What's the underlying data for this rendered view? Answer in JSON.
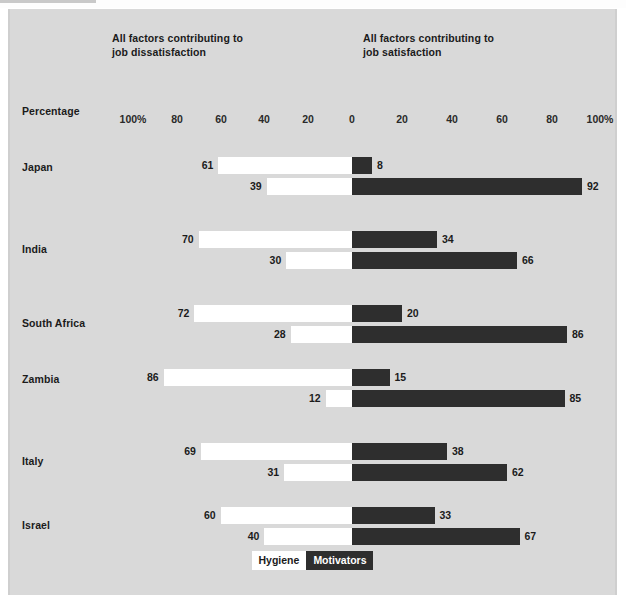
{
  "headers": {
    "dissatisfaction": "All factors contributing to\njob dissatisfaction",
    "satisfaction": "All factors contributing to\njob satisfaction",
    "axis_title": "Percentage"
  },
  "legend": {
    "hygiene": "Hygiene",
    "motivators": "Motivators"
  },
  "ticks": [
    {
      "label": "100%",
      "x": 133
    },
    {
      "label": "80",
      "x": 177
    },
    {
      "label": "60",
      "x": 221
    },
    {
      "label": "40",
      "x": 264
    },
    {
      "label": "20",
      "x": 308
    },
    {
      "label": "0",
      "x": 352
    },
    {
      "label": "20",
      "x": 402
    },
    {
      "label": "40",
      "x": 452
    },
    {
      "label": "60",
      "x": 502
    },
    {
      "label": "80",
      "x": 552
    },
    {
      "label": "100%",
      "x": 600
    }
  ],
  "chart_data": {
    "type": "bar",
    "xlabel": "Percentage",
    "ylabel": "",
    "xlim": [
      -100,
      100
    ],
    "grid": false,
    "legend_position": "bottom-center",
    "orientation": "horizontal-diverging",
    "series": [
      {
        "name": "Hygiene",
        "color": "#ffffff"
      },
      {
        "name": "Motivators",
        "color": "#2e2e2e"
      }
    ],
    "categories": [
      "Japan",
      "India",
      "South Africa",
      "Zambia",
      "Italy",
      "Israel"
    ],
    "rows": [
      {
        "country": "Japan",
        "bars": [
          {
            "series": "Motivators",
            "dissatisfaction": 61,
            "satisfaction": 8
          },
          {
            "series": "Hygiene",
            "dissatisfaction": 39,
            "satisfaction": 92
          }
        ]
      },
      {
        "country": "India",
        "bars": [
          {
            "series": "Motivators",
            "dissatisfaction": 70,
            "satisfaction": 34
          },
          {
            "series": "Hygiene",
            "dissatisfaction": 30,
            "satisfaction": 66
          }
        ]
      },
      {
        "country": "South Africa",
        "bars": [
          {
            "series": "Motivators",
            "dissatisfaction": 72,
            "satisfaction": 20
          },
          {
            "series": "Hygiene",
            "dissatisfaction": 28,
            "satisfaction": 86
          }
        ]
      },
      {
        "country": "Zambia",
        "bars": [
          {
            "series": "Motivators",
            "dissatisfaction": 86,
            "satisfaction": 15
          },
          {
            "series": "Hygiene",
            "dissatisfaction": 12,
            "satisfaction": 85
          }
        ]
      },
      {
        "country": "Italy",
        "bars": [
          {
            "series": "Motivators",
            "dissatisfaction": 69,
            "satisfaction": 38
          },
          {
            "series": "Hygiene",
            "dissatisfaction": 31,
            "satisfaction": 62
          }
        ]
      },
      {
        "country": "Israel",
        "bars": [
          {
            "series": "Motivators",
            "dissatisfaction": 60,
            "satisfaction": 33
          },
          {
            "series": "Hygiene",
            "dissatisfaction": 40,
            "satisfaction": 67
          }
        ]
      }
    ]
  },
  "geometry": {
    "zero_x": 352,
    "left_px_per_pct": 2.19,
    "right_px_per_pct": 2.5,
    "row_tops": [
      148,
      222,
      296,
      360,
      434,
      498
    ],
    "label_offsets": [
      8,
      16,
      16,
      8,
      16,
      16
    ],
    "row_gap": 21
  },
  "colors": {
    "panel": "#d9d9d9",
    "hygiene": "#ffffff",
    "motivators": "#2e2e2e",
    "text": "#1b1b1b"
  }
}
